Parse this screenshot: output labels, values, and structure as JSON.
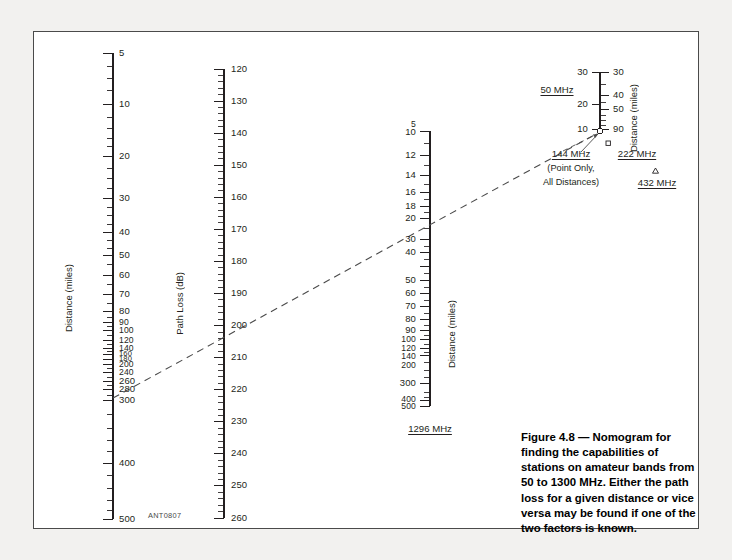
{
  "figure": {
    "id_code": "ANT0807",
    "caption": "Figure 4.8 — Nomogram for finding the capabilities of stations on amateur bands from 50 to 1300 MHz. Either the path loss for a given distance or vice versa may be found if one of the two factors is known."
  },
  "chart_data": {
    "type": "nomogram",
    "title": "Nomogram for finding the capabilities of stations on amateur bands from 50 to 1300 MHz",
    "axes": [
      {
        "name": "distance-left",
        "label": "Distance (miles)",
        "unit": "miles",
        "scale": "logarithmic",
        "orientation": "vertical",
        "direction": "top-to-bottom increasing",
        "range": [
          5,
          500
        ],
        "ticks": [
          5,
          10,
          20,
          30,
          40,
          50,
          60,
          70,
          80,
          90,
          100,
          120,
          140,
          160,
          180,
          200,
          240,
          260,
          280,
          300,
          400,
          500
        ],
        "labels": [
          "5",
          "10",
          "20",
          "30",
          "40",
          "50",
          "60",
          "70",
          "80",
          "90",
          "100",
          "120",
          "140",
          "160",
          "180",
          "200",
          "240",
          "260",
          "280",
          "300",
          "400",
          "500"
        ]
      },
      {
        "name": "path-loss",
        "label": "Path Loss (dB)",
        "unit": "dB",
        "scale": "linear",
        "orientation": "vertical",
        "direction": "top-to-bottom increasing",
        "range": [
          120,
          260
        ],
        "ticks": [
          120,
          130,
          140,
          150,
          160,
          170,
          180,
          190,
          200,
          210,
          220,
          230,
          240,
          250,
          260
        ],
        "labels": [
          "120",
          "130",
          "140",
          "150",
          "160",
          "170",
          "180",
          "190",
          "200",
          "210",
          "220",
          "230",
          "240",
          "250",
          "260"
        ]
      },
      {
        "name": "distance-1296",
        "label": "Distance (miles)",
        "unit": "miles",
        "scale": "logarithmic",
        "orientation": "vertical",
        "direction": "top-to-bottom increasing",
        "band": "1296 MHz",
        "range": [
          5,
          500
        ],
        "ticks": [
          5,
          10,
          12,
          14,
          16,
          18,
          20,
          30,
          40,
          50,
          60,
          70,
          80,
          90,
          100,
          120,
          140,
          200,
          300,
          400,
          500
        ],
        "labels": [
          "5",
          "10",
          "12",
          "14",
          "16",
          "18",
          "20",
          "30",
          "40",
          "50",
          "60",
          "70",
          "80",
          "90",
          "100",
          "120",
          "140",
          "200",
          "300",
          "400",
          "500"
        ]
      },
      {
        "name": "distance-vhf-uhf",
        "label": "Distance (miles)",
        "unit": "miles",
        "scale": "logarithmic",
        "orientation": "vertical",
        "left_band": "50 MHz",
        "right_band": "222 MHz",
        "left_ticks": [
          30,
          20,
          10
        ],
        "left_labels": [
          "30",
          "20",
          "10"
        ],
        "right_ticks": [
          30,
          40,
          50,
          90
        ],
        "right_labels": [
          "30",
          "40",
          "50",
          "90"
        ]
      }
    ],
    "bands": [
      {
        "label": "50 MHz",
        "position": "left-of-fourth-axis"
      },
      {
        "label": "144 MHz",
        "note": "(Point Only, All Distances)",
        "position": "below-fourth-axis"
      },
      {
        "label": "222 MHz",
        "marker": "square",
        "position": "below-right"
      },
      {
        "label": "432 MHz",
        "marker": "triangle",
        "position": "below-right"
      },
      {
        "label": "1296 MHz",
        "position": "below-third-axis"
      }
    ],
    "index_line": {
      "style": "dashed",
      "readings": [
        {
          "axis": "distance-left",
          "value": 290,
          "unit": "miles"
        },
        {
          "axis": "path-loss",
          "value": 214,
          "unit": "dB"
        },
        {
          "axis": "distance-1296",
          "value": 25,
          "unit": "miles"
        },
        {
          "axis": "distance-vhf-uhf",
          "value": 10,
          "unit": "miles"
        }
      ]
    }
  },
  "axis1": {
    "title": "Distance (miles)",
    "labels": [
      "5",
      "10",
      "20",
      "30",
      "40",
      "50",
      "60",
      "70",
      "80",
      "90",
      "100",
      "120",
      "140",
      "160",
      "180",
      "200",
      "240",
      "260",
      "280",
      "300",
      "400",
      "500"
    ]
  },
  "axis2": {
    "title": "Path Loss (dB)",
    "labels": [
      "120",
      "130",
      "140",
      "150",
      "160",
      "170",
      "180",
      "190",
      "200",
      "210",
      "220",
      "230",
      "240",
      "250",
      "260"
    ]
  },
  "axis3": {
    "title": "Distance (miles)",
    "band": "1296 MHz",
    "labels": [
      "5",
      "10",
      "12",
      "14",
      "16",
      "18",
      "20",
      "30",
      "40",
      "50",
      "60",
      "70",
      "80",
      "90",
      "100",
      "120",
      "140",
      "200",
      "300",
      "400",
      "500"
    ]
  },
  "axis4": {
    "title": "Distance (miles)",
    "left_labels": [
      "30",
      "20",
      "10"
    ],
    "right_labels": [
      "30",
      "40",
      "50",
      "90"
    ],
    "band_left": "50 MHz",
    "band_144": "144 MHz",
    "note_144_line1": "(Point Only,",
    "note_144_line2": "All Distances)",
    "band_222": "222 MHz",
    "band_432": "432 MHz"
  }
}
